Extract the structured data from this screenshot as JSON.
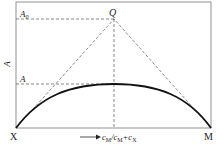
{
  "diagram": {
    "title": "",
    "y_axis_label": "A",
    "x_axis_label": "c_M/c_M+c_X",
    "x_axis_label_parts": {
      "c1": "c",
      "s1": "M",
      "slash": "/c",
      "s2": "M",
      "plus": "+c",
      "s3": "X"
    },
    "left_endpoint": "X",
    "right_endpoint": "M",
    "extrapolated_max_label": "A0",
    "extrapolated_max_parts": {
      "base": "A",
      "sub": "0"
    },
    "observed_max_label": "A",
    "intersection_point_label": "Q",
    "colors": {
      "line": "#222222",
      "dashed": "#555555",
      "frame": "#666666"
    }
  }
}
